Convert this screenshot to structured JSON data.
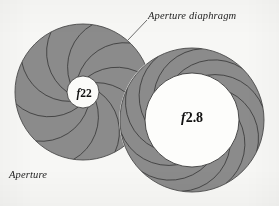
{
  "figure": {
    "background_color": "#f7f7f5"
  },
  "labels": {
    "diaphragm": "Aperture diaphragm",
    "aperture": "Aperture"
  },
  "apertures": [
    {
      "name": "stopped-down-aperture",
      "f_prefix": "f",
      "f_number": "22",
      "f_stop_full": "f22",
      "center_x": 83,
      "center_y": 92,
      "outer_radius": 68,
      "opening_radius": 16,
      "blade_count": 10,
      "blade_fill": "#8b8b8b",
      "blade_edge": "#3a3a3a",
      "opening_fill": "#fbfbf9"
    },
    {
      "name": "wide-open-aperture",
      "f_prefix": "f",
      "f_number": "2.8",
      "f_stop_full": "f2.8",
      "center_x": 192,
      "center_y": 120,
      "outer_radius": 72,
      "opening_radius": 47,
      "blade_count": 10,
      "blade_fill": "#8b8b8b",
      "blade_edge": "#3a3a3a",
      "opening_fill": "#fdfdfb"
    }
  ],
  "leader_line": {
    "name": "diaphragm-leader-line",
    "from_x": 147,
    "from_y": 20,
    "to_x": 128,
    "to_y": 40,
    "color": "#4a4a4a"
  },
  "colors": {
    "blade_fill": "#8b8b8b",
    "blade_edge": "#3a3a3a",
    "outline": "#4a4a4a",
    "text": "#1c1c1c",
    "paper": "#f7f7f5"
  },
  "chart_data": {
    "type": "diagram",
    "title": "Aperture diaphragm",
    "annotations": [
      "Aperture diaphragm",
      "Aperture"
    ],
    "items": [
      {
        "label": "f22",
        "opening_radius_px": 16,
        "outer_radius_px": 68,
        "blades": 10
      },
      {
        "label": "f2.8",
        "opening_radius_px": 47,
        "outer_radius_px": 72,
        "blades": 10
      }
    ]
  }
}
